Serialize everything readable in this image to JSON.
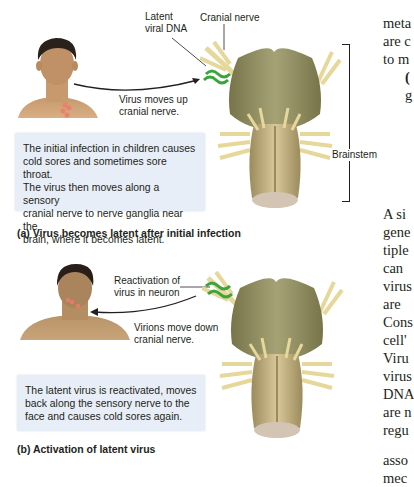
{
  "panel_a": {
    "labels": {
      "latent_viral_dna_line1": "Latent",
      "latent_viral_dna_line2": "viral DNA",
      "cranial_nerve": "Cranial nerve",
      "virus_moves_up_line1": "Virus moves up",
      "virus_moves_up_line2": "cranial nerve.",
      "brainstem": "Brainstem"
    },
    "description": [
      "The initial infection in children causes",
      "cold sores and sometimes sore throat.",
      "The virus then moves along a sensory",
      "cranial nerve to nerve ganglia near the",
      "brain, where it becomes latent."
    ],
    "caption": "(a) Virus becomes latent after initial infection"
  },
  "panel_b": {
    "labels": {
      "reactivation_line1": "Reactivation of",
      "reactivation_line2": "virus in neuron",
      "virions_move_down_line1": "Virions move down",
      "virions_move_down_line2": "cranial nerve."
    },
    "description": [
      "The latent virus is reactivated, moves",
      "back along the sensory nerve to the",
      "face and causes cold sores again."
    ],
    "caption": "(b) Activation of latent virus"
  },
  "body_text_top": [
    "meta",
    "are c",
    "to m",
    "(",
    "g"
  ],
  "body_text_bottom": [
    "A si",
    "gene",
    "tiple",
    "can",
    "virus",
    "are",
    "Cons",
    "cell'",
    "Viru",
    "virus",
    "DNA",
    "are n",
    "regu",
    "",
    "asso",
    "mec"
  ],
  "colors": {
    "box_bg": "#e8eef7",
    "brainstem": "#8b8a5a",
    "nerve": "#e6d79a",
    "viral_dna": "#3aa53a",
    "infection": "#f07a6a"
  }
}
